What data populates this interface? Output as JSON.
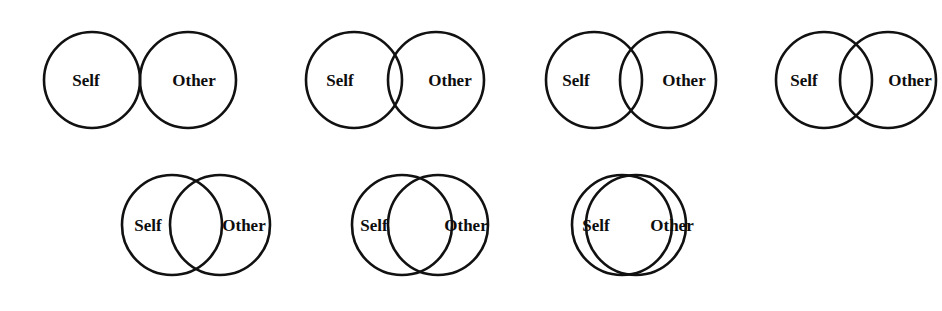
{
  "figure": {
    "name": "inclusion-of-other-in-the-self-scale",
    "background_color": "#ffffff",
    "stroke_color": "#111111",
    "label_color": "#0d0d0d"
  },
  "labels": {
    "self": "Self",
    "other": "Other"
  },
  "rows": [
    {
      "id": "row-top",
      "circle_radius": 48,
      "center_y": 80,
      "items": [
        {
          "index": 1,
          "width": 244,
          "self_cx": 72,
          "other_cx": 168,
          "self_label_x": 66,
          "other_label_x": 174,
          "label_y": 82,
          "font_size": 17
        },
        {
          "index": 2,
          "width": 212,
          "self_cx": 62,
          "other_cx": 144,
          "self_label_x": 48,
          "other_label_x": 158,
          "label_y": 82,
          "font_size": 17
        },
        {
          "index": 3,
          "width": 204,
          "self_cx": 62,
          "other_cx": 136,
          "self_label_x": 44,
          "other_label_x": 152,
          "label_y": 82,
          "font_size": 17
        },
        {
          "index": 4,
          "width": 188,
          "self_cx": 60,
          "other_cx": 124,
          "self_label_x": 40,
          "other_label_x": 146,
          "label_y": 82,
          "font_size": 17
        }
      ]
    },
    {
      "id": "row-bottom",
      "circle_radius": 50,
      "center_y": 65,
      "items": [
        {
          "index": 5,
          "width": 210,
          "self_cx": 64,
          "other_cx": 112,
          "self_label_x": 40,
          "other_label_x": 136,
          "label_y": 67,
          "font_size": 17
        },
        {
          "index": 6,
          "width": 198,
          "self_cx": 62,
          "other_cx": 98,
          "self_label_x": 34,
          "other_label_x": 126,
          "label_y": 67,
          "font_size": 17
        },
        {
          "index": 7,
          "width": 198,
          "self_cx": 62,
          "other_cx": 76,
          "self_label_x": 36,
          "other_label_x": 112,
          "label_y": 67,
          "font_size": 17
        }
      ]
    }
  ],
  "layout": {
    "row_top_padding_left": 20,
    "row_top_gap": 28,
    "row_bottom_padding_left": 108,
    "row_bottom_gap": 22
  }
}
